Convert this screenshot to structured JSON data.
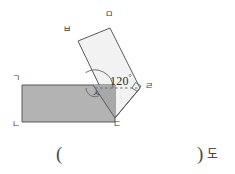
{
  "figure": {
    "colors": {
      "shaded_rectangle_fill": "#b3b3b3",
      "rotated_rectangle_fill": "#f2f2f2",
      "stroke": "#595959",
      "label_text": "#3c3c3c",
      "background": "#ffffff"
    },
    "vertices": [
      {
        "id": "g",
        "label": "ㄱ",
        "x": 12,
        "y": 74,
        "role": "shaded-rect-top-left"
      },
      {
        "id": "n",
        "label": "ㄴ",
        "x": 12,
        "y": 120,
        "role": "shaded-rect-bottom-left"
      },
      {
        "id": "d",
        "label": "ㄷ",
        "x": 113,
        "y": 120,
        "role": "shared-bottom-right"
      },
      {
        "id": "r",
        "label": "ㄹ",
        "x": 145,
        "y": 82,
        "role": "rotated-rect-right"
      },
      {
        "id": "m",
        "label": "ㅁ",
        "x": 105,
        "y": 10,
        "role": "rotated-rect-top"
      },
      {
        "id": "b",
        "label": "ㅂ",
        "x": 63,
        "y": 25,
        "role": "rotated-rect-upper-left"
      },
      {
        "id": "s",
        "label": "ㅅ",
        "x": 92,
        "y": 89,
        "role": "intersection-point"
      }
    ],
    "angle": {
      "value": "120",
      "degree_symbol": "°",
      "at_vertex": "ㅅ",
      "between": [
        "dashed-horizontal-ray",
        "edge-s-to-b"
      ]
    },
    "right_angle_marker": {
      "at_vertex": "ㄹ",
      "symbol": "square"
    },
    "dashed_segment": {
      "from": "ㅅ",
      "to": "ㄹ"
    }
  },
  "answer": {
    "open_paren": "(",
    "close_paren": ")",
    "unit": "도"
  }
}
